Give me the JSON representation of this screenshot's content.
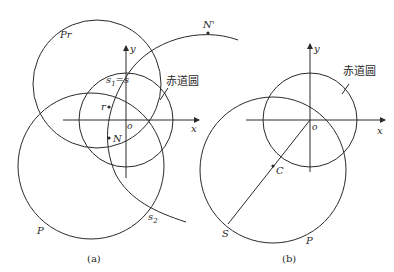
{
  "figure": {
    "panel_a": {
      "caption": "(a)",
      "labels": {
        "pr": "Pr",
        "n_prime": "N'",
        "y_axis": "y",
        "x_axis": "x",
        "origin": "o",
        "s1_eq_s": "s",
        "s1_sub": "1",
        "s1_eq_s_rest": "=s",
        "r": "r",
        "n": "N",
        "equator": "赤道圆",
        "p": "P",
        "s2": "s",
        "s2_sub": "2"
      }
    },
    "panel_b": {
      "caption": "(b)",
      "labels": {
        "y_axis": "y",
        "x_axis": "x",
        "origin": "o",
        "equator": "赤道圆",
        "c": "C",
        "s": "S",
        "p": "P"
      }
    },
    "colors": {
      "line": "#2a2a2a",
      "background": "#ffffff"
    }
  }
}
